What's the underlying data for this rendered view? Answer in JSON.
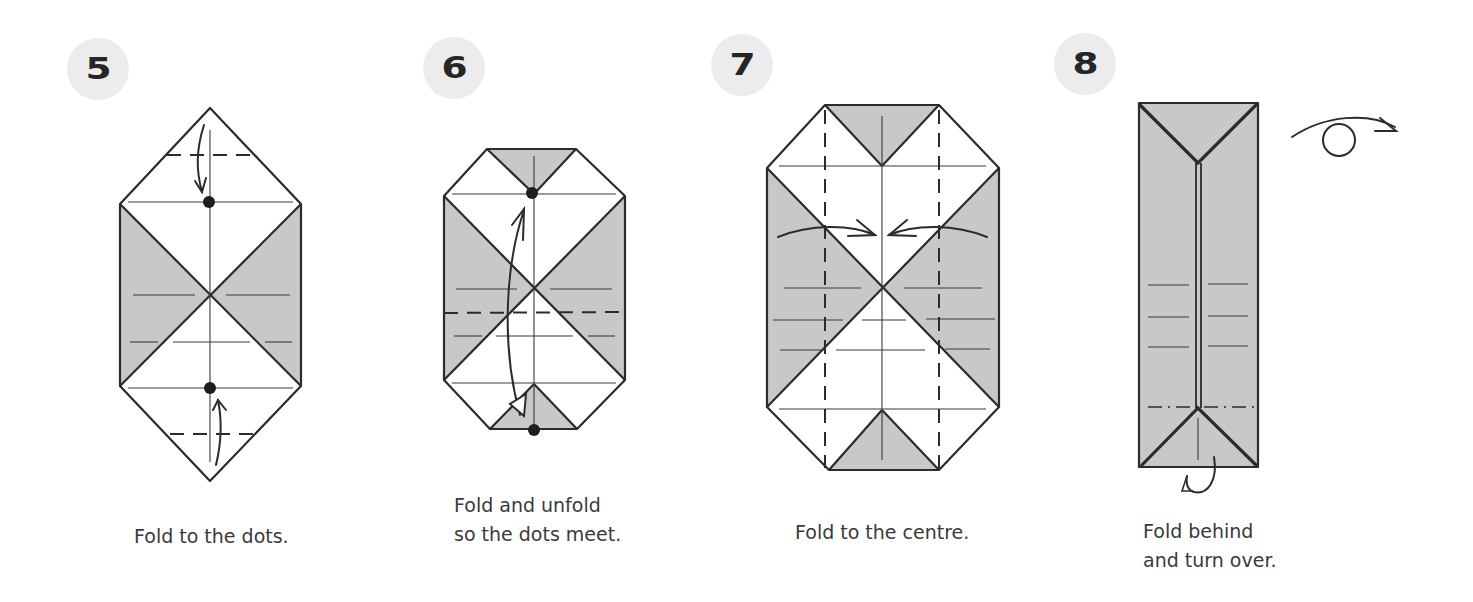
{
  "steps": [
    {
      "number": "5",
      "caption": "Fold to the dots."
    },
    {
      "number": "6",
      "caption": "Fold and unfold\nso the dots meet."
    },
    {
      "number": "7",
      "caption": "Fold to the centre."
    },
    {
      "number": "8",
      "caption": "Fold behind\nand turn over."
    }
  ],
  "colors": {
    "paper_grey": "#c8c8c8",
    "badge_bg": "#ececec",
    "line": "#2b2b2b",
    "caption_text": "#3a3a3a"
  },
  "symbols": {
    "step5": [
      "valley-fold-line-top",
      "fold-arrow-down",
      "dot-top",
      "valley-fold-line-bottom",
      "fold-arrow-up",
      "dot-bottom"
    ],
    "step6": [
      "valley-fold-line",
      "fold-unfold-arrow",
      "dot-top",
      "dot-bottom"
    ],
    "step7": [
      "valley-fold-line-left",
      "valley-fold-line-right",
      "fold-arrow-left-to-centre",
      "fold-arrow-right-to-centre"
    ],
    "step8": [
      "mountain-fold-line",
      "fold-behind-arrow",
      "turn-over-arrow"
    ]
  }
}
